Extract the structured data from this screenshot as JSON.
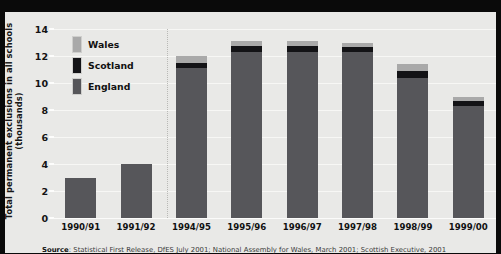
{
  "chart_data": {
    "type": "bar",
    "stacked": true,
    "title": "",
    "xlabel": "",
    "ylabel": "Total permanent exclusions in all schools (thousands)",
    "ylim": [
      0,
      14
    ],
    "yticks": [
      0,
      2,
      4,
      6,
      8,
      10,
      12,
      14
    ],
    "grid": true,
    "legend_position": "upper-left-inside",
    "categories": [
      "1990/91",
      "1991/92",
      "1994/95",
      "1995/96",
      "1996/97",
      "1997/98",
      "1998/99",
      "1999/00"
    ],
    "series": [
      {
        "name": "England",
        "color": "#56565a",
        "values": [
          3.0,
          4.0,
          11.1,
          12.3,
          12.3,
          12.3,
          10.4,
          8.3
        ]
      },
      {
        "name": "Scotland",
        "color": "#131316",
        "values": [
          0,
          0,
          0.4,
          0.45,
          0.45,
          0.4,
          0.5,
          0.35
        ]
      },
      {
        "name": "Wales",
        "color": "#a9a9a9",
        "values": [
          0,
          0,
          0.5,
          0.35,
          0.35,
          0.3,
          0.5,
          0.35
        ]
      }
    ],
    "totals": [
      3.0,
      4.0,
      12.0,
      13.1,
      13.1,
      13.0,
      11.4,
      9.0
    ],
    "gap_after_index": 1
  },
  "axis": {
    "y_tick_labels": [
      "14",
      "12",
      "10",
      "8",
      "6",
      "4",
      "2",
      "0"
    ],
    "y_title": "Total permanent exclusions in all schools (thousands)",
    "x_tick_labels": [
      "1990/91",
      "1991/92",
      "1994/95",
      "1995/96",
      "1996/97",
      "1997/98",
      "1998/99",
      "1999/00"
    ]
  },
  "legend": {
    "items": [
      {
        "label": "Wales",
        "color": "#a9a9a9"
      },
      {
        "label": "Scotland",
        "color": "#131316"
      },
      {
        "label": "England",
        "color": "#56565a"
      }
    ]
  },
  "source": {
    "prefix": "Source",
    "separator": ": ",
    "text": "Statistical First Release, DfES July 2001; National Assembly for Wales, March 2001; Scottish Executive, 2001"
  }
}
